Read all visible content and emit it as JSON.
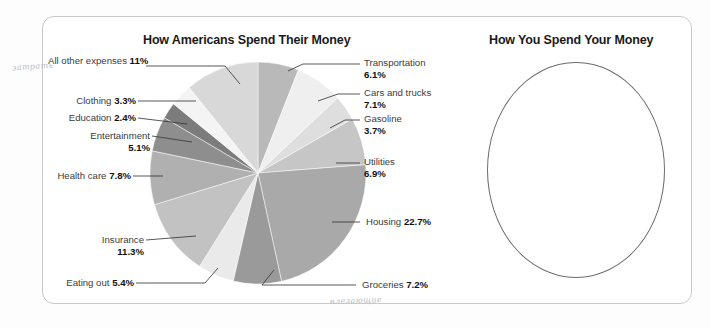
{
  "page": {
    "background": "#ffffff",
    "panel_border_color": "#c9c9c9"
  },
  "left_chart": {
    "title": "How Americans Spend Their Money"
  },
  "right_chart": {
    "title": "How You Spend Your Money",
    "shape": "empty-circle",
    "outline_color": "#6b6b6b"
  },
  "annotations": {
    "handwriting_left": "затрать",
    "handwriting_bottom": "влезающие"
  },
  "labels": {
    "all_other": {
      "name": "All other expenses",
      "value": "11%"
    },
    "clothing": {
      "name": "Clothing",
      "value": "3.3%"
    },
    "education": {
      "name": "Education",
      "value": "2.4%"
    },
    "entertainment": {
      "name": "Entertainment",
      "value": "5.1%"
    },
    "health_care": {
      "name": "Health care",
      "value": "7.8%"
    },
    "insurance": {
      "name": "Insurance",
      "value": "11.3%"
    },
    "eating_out": {
      "name": "Eating out",
      "value": "5.4%"
    },
    "groceries": {
      "name": "Groceries",
      "value": "7.2%"
    },
    "housing": {
      "name": "Housing",
      "value": "22.7%"
    },
    "utilities": {
      "name": "Utilities",
      "value": "6.9%"
    },
    "gasoline": {
      "name": "Gasoline",
      "value": "3.7%"
    },
    "cars": {
      "name": "Cars and trucks",
      "value": "7.1%"
    },
    "transportation": {
      "name": "Transportation",
      "value": "6.1%"
    }
  },
  "chart_data": {
    "type": "pie",
    "title": "How Americans Spend Their Money",
    "xlabel": "",
    "ylabel": "",
    "legend": "none",
    "start_angle_deg": 0,
    "direction": "clockwise",
    "units": "percent of spending",
    "categories": [
      "Transportation",
      "Cars and trucks",
      "Gasoline",
      "Utilities",
      "Housing",
      "Groceries",
      "Eating out",
      "Insurance",
      "Health care",
      "Entertainment",
      "Education",
      "Clothing",
      "All other expenses"
    ],
    "values": [
      6.1,
      7.1,
      3.7,
      6.9,
      22.7,
      7.2,
      5.4,
      11.3,
      7.8,
      5.1,
      2.4,
      3.3,
      11.0
    ],
    "colors": [
      "#b9b9b9",
      "#efefef",
      "#dedede",
      "#c6c6c6",
      "#a9a9a9",
      "#9a9a9a",
      "#eaeaea",
      "#c2c2c2",
      "#b0b0b0",
      "#8e8e8e",
      "#7c7c7c",
      "#f4f4f4",
      "#d8d8d8"
    ],
    "labels_shown": [
      "Transportation 6.1%",
      "Cars and trucks 7.1%",
      "Gasoline 3.7%",
      "Utilities 6.9%",
      "Housing 22.7%",
      "Groceries 7.2%",
      "Eating out 5.4%",
      "Insurance 11.3%",
      "Health care 7.8%",
      "Entertainment 5.1%",
      "Education 2.4%",
      "Clothing 3.3%",
      "All other expenses 11%"
    ],
    "total": 100.0
  }
}
